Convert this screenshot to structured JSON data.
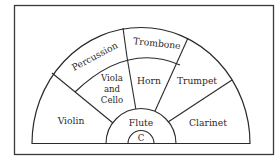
{
  "diagram": {
    "colors": {
      "ink": "#2a2a2a",
      "paper": "#ffffff",
      "frame": "#3a3a3a"
    },
    "conductor": {
      "label": "C"
    },
    "sections": [
      {
        "id": "percussion",
        "label": "Percussion"
      },
      {
        "id": "trombone",
        "label": "Trombone"
      },
      {
        "id": "viola-cello",
        "label_lines": [
          "Viola",
          "and",
          "Cello"
        ]
      },
      {
        "id": "horn",
        "label": "Horn"
      },
      {
        "id": "trumpet",
        "label": "Trumpet"
      },
      {
        "id": "violin",
        "label": "Violin"
      },
      {
        "id": "flute",
        "label": "Flute"
      },
      {
        "id": "clarinet",
        "label": "Clarinet"
      }
    ]
  }
}
